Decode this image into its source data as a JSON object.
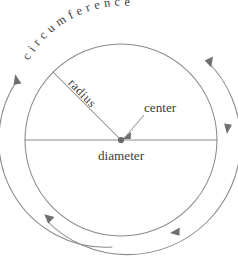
{
  "diagram": {
    "labels": {
      "circumference": "circumference",
      "radius": "radius",
      "center": "center",
      "diameter": "diameter"
    },
    "geometry": {
      "center_x": 121,
      "center_y": 140,
      "radius": 96,
      "outer_arc_radius": 107,
      "diameter_left_x": 25,
      "diameter_right_x": 217,
      "radius_line_end_x": 53,
      "radius_line_end_y": 72
    },
    "colors": {
      "stroke": "#8a8a8a",
      "text": "#3c3c3c",
      "arrow": "#6f6f6f",
      "background": "#ffffff",
      "center_dot": "#6a6a6a"
    },
    "curved_text": {
      "circumference_letters": [
        "c",
        "i",
        "r",
        "c",
        "u",
        "m",
        "f",
        "e",
        "r",
        "e",
        "n",
        "c",
        "e"
      ]
    }
  }
}
